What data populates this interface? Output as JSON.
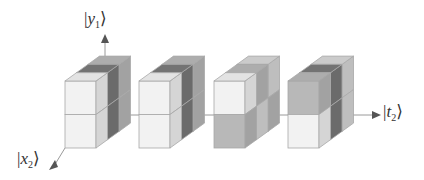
{
  "axes": {
    "y_label": {
      "bar": "|",
      "var": "y",
      "sub": "1",
      "close": "⟩"
    },
    "x_label": {
      "bar": "|",
      "var": "x",
      "sub": "2",
      "close": "⟩"
    },
    "t_label": {
      "bar": "|",
      "var": "t",
      "sub": "2",
      "close": "⟩"
    },
    "line_color": "#9a9a9a",
    "arrow_color": "#555555"
  },
  "geometry": {
    "front_width": 31,
    "cube_height": 33.5,
    "front_top": 81,
    "slab_dx": 11.5,
    "slab_dy": -8.3,
    "slabs": 3,
    "rows": 2
  },
  "colors": {
    "white": "#f2f2f2",
    "light": "#d8d8d8",
    "mid": "#b8b8b8",
    "dark": "#7a7a7a",
    "edge": "#a8a8a8"
  },
  "blocks": [
    {
      "name": "block-1",
      "x": 65,
      "cells": {
        "top_row": [
          "white",
          "dark",
          "mid"
        ],
        "bottom_row": [
          "white",
          "dark",
          "mid"
        ]
      }
    },
    {
      "name": "block-2",
      "x": 139,
      "cells": {
        "top_row": [
          "white",
          "dark",
          "mid"
        ],
        "bottom_row": [
          "white",
          "dark",
          "mid"
        ]
      }
    },
    {
      "name": "block-3",
      "x": 214,
      "cells": {
        "top_row": [
          "white",
          "mid",
          "light"
        ],
        "bottom_row": [
          "mid",
          "light",
          "mid"
        ]
      }
    },
    {
      "name": "block-4",
      "x": 288,
      "cells": {
        "top_row": [
          "mid",
          "dark",
          "light"
        ],
        "bottom_row": [
          "white",
          "dark",
          "light"
        ]
      }
    }
  ]
}
